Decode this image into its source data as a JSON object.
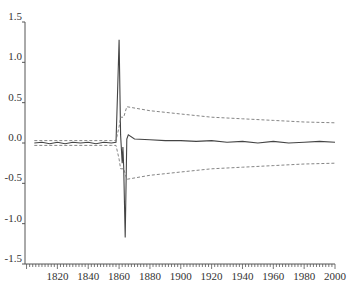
{
  "chart_data": {
    "type": "line",
    "title": "",
    "xlabel": "",
    "ylabel": "",
    "xlim": [
      1799,
      2000
    ],
    "ylim": [
      -1.5,
      1.5
    ],
    "grid": false,
    "legend": null,
    "x_ticks": [
      1820,
      1840,
      1860,
      1880,
      1900,
      1920,
      1940,
      1960,
      1980,
      2000
    ],
    "y_ticks": [
      -1.5,
      -1.0,
      -0.5,
      0.0,
      0.5,
      1.0,
      1.5
    ],
    "x_tick_labels": [
      "1820",
      "1840",
      "1860",
      "1880",
      "1900",
      "1920",
      "1940",
      "1960",
      "1980",
      "2000"
    ],
    "y_tick_labels": [
      "-1.5",
      "-1.0",
      "-0.5",
      "0.0",
      "0.5",
      "1.0",
      "1.5"
    ],
    "series": [
      {
        "name": "response",
        "style": "solid",
        "color": "#444444",
        "points": [
          [
            1805,
            0.0
          ],
          [
            1810,
            0.01
          ],
          [
            1815,
            -0.01
          ],
          [
            1820,
            0.01
          ],
          [
            1825,
            -0.01
          ],
          [
            1830,
            0.01
          ],
          [
            1835,
            0.0
          ],
          [
            1840,
            0.01
          ],
          [
            1845,
            -0.01
          ],
          [
            1850,
            0.01
          ],
          [
            1855,
            0.0
          ],
          [
            1858,
            0.01
          ],
          [
            1859,
            0.6
          ],
          [
            1860,
            1.28
          ],
          [
            1861,
            0.1
          ],
          [
            1862,
            -0.25
          ],
          [
            1862.5,
            -0.05
          ],
          [
            1863,
            -0.3
          ],
          [
            1864,
            -1.17
          ],
          [
            1865,
            0.05
          ],
          [
            1866,
            0.1
          ],
          [
            1870,
            0.05
          ],
          [
            1880,
            0.04
          ],
          [
            1890,
            0.03
          ],
          [
            1900,
            0.03
          ],
          [
            1910,
            0.02
          ],
          [
            1920,
            0.03
          ],
          [
            1930,
            0.01
          ],
          [
            1940,
            0.02
          ],
          [
            1950,
            0.0
          ],
          [
            1960,
            0.02
          ],
          [
            1970,
            0.0
          ],
          [
            1980,
            0.01
          ],
          [
            1990,
            0.02
          ],
          [
            2000,
            0.01
          ]
        ]
      },
      {
        "name": "upper band",
        "style": "dashed",
        "color": "#777777",
        "points": [
          [
            1805,
            0.03
          ],
          [
            1855,
            0.03
          ],
          [
            1858,
            0.03
          ],
          [
            1860,
            0.2
          ],
          [
            1861,
            0.32
          ],
          [
            1863,
            0.32
          ],
          [
            1865,
            0.45
          ],
          [
            1880,
            0.4
          ],
          [
            1900,
            0.36
          ],
          [
            1920,
            0.32
          ],
          [
            1940,
            0.3
          ],
          [
            1960,
            0.28
          ],
          [
            1980,
            0.26
          ],
          [
            2000,
            0.25
          ]
        ]
      },
      {
        "name": "lower band",
        "style": "dashed",
        "color": "#777777",
        "points": [
          [
            1805,
            -0.03
          ],
          [
            1855,
            -0.03
          ],
          [
            1858,
            -0.03
          ],
          [
            1860,
            -0.2
          ],
          [
            1861,
            -0.32
          ],
          [
            1863,
            -0.32
          ],
          [
            1865,
            -0.45
          ],
          [
            1880,
            -0.4
          ],
          [
            1900,
            -0.36
          ],
          [
            1920,
            -0.32
          ],
          [
            1940,
            -0.3
          ],
          [
            1960,
            -0.28
          ],
          [
            1980,
            -0.26
          ],
          [
            2000,
            -0.25
          ]
        ]
      }
    ]
  }
}
